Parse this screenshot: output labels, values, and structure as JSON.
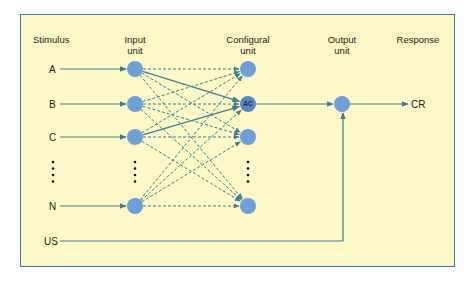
{
  "headers": {
    "stimulus": "Stimulus",
    "input_line1": "Input",
    "input_line2": "unit",
    "configural_line1": "Configural",
    "configural_line2": "unit",
    "output_line1": "Output",
    "output_line2": "unit",
    "response": "Response"
  },
  "stimuli": [
    {
      "label": "A",
      "y": 69
    },
    {
      "label": "B",
      "y": 104
    },
    {
      "label": "C",
      "y": 137
    },
    {
      "label": "N",
      "y": 206
    }
  ],
  "us_label": "US",
  "configural_nodes": [
    {
      "label": "",
      "y": 69
    },
    {
      "label": "AC",
      "y": 104
    },
    {
      "label": "",
      "y": 137
    },
    {
      "label": "",
      "y": 206
    }
  ],
  "solid_connections": [
    [
      "A",
      "AC"
    ],
    [
      "C",
      "AC"
    ]
  ],
  "response_label": "CR",
  "colors": {
    "background": "#fdf8c8",
    "border": "#3f7f98",
    "line": "#3c7f8e",
    "node": "#6e9fd6",
    "node_ac": "#5b86c4"
  }
}
